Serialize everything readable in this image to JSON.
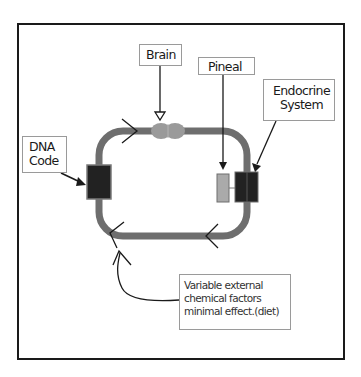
{
  "diagram": {
    "labels": {
      "brain": "Brain",
      "pineal": "Pineal",
      "endocrine": [
        "Endocrine",
        "System"
      ],
      "dna": [
        "DNA",
        "Code"
      ],
      "external": [
        "Variable external",
        "chemical factors",
        "minimal effect.(diet)"
      ]
    },
    "nodes": [
      {
        "id": "brain",
        "shape": "blob",
        "color": "#9a9a9a"
      },
      {
        "id": "dna-code",
        "shape": "rect",
        "color": "#222222"
      },
      {
        "id": "pineal",
        "shape": "rect",
        "color": "#aaaaaa"
      },
      {
        "id": "endocrine-system",
        "shape": "rect",
        "color": "#222222"
      }
    ],
    "loop": {
      "color": "#6e6e6e",
      "direction": "clockwise"
    },
    "edges": [
      {
        "from": "Brain label",
        "to": "brain"
      },
      {
        "from": "Pineal label",
        "to": "pineal"
      },
      {
        "from": "Endocrine System label",
        "to": "endocrine-system"
      },
      {
        "from": "DNA Code label",
        "to": "dna-code"
      },
      {
        "from": "Variable external chemical factors",
        "to": "loop bottom-left"
      }
    ]
  }
}
